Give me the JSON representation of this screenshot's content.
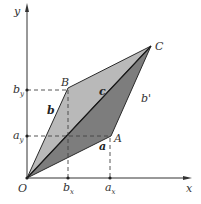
{
  "diagram": {
    "type": "vector-addition-parallelogram",
    "axes": {
      "x_label": "x",
      "y_label": "y",
      "origin_label": "O"
    },
    "points": {
      "O": {
        "label": "O",
        "px": [
          27,
          178
        ]
      },
      "A": {
        "label": "A",
        "px": [
          111,
          136
        ]
      },
      "B": {
        "label": "B",
        "px": [
          68,
          88
        ]
      },
      "C": {
        "label": "C",
        "px": [
          151,
          46
        ]
      }
    },
    "vectors": {
      "a": {
        "label": "a",
        "from": "O",
        "to": "A"
      },
      "b": {
        "label": "b",
        "from": "O",
        "to": "B"
      },
      "c": {
        "label": "c",
        "from": "O",
        "to": "C"
      },
      "b_prime": {
        "label": "b'",
        "from": "A",
        "to": "C"
      }
    },
    "ticks": {
      "x": [
        {
          "base": "b",
          "sub": "x"
        },
        {
          "base": "a",
          "sub": "x"
        }
      ],
      "y": [
        {
          "base": "b",
          "sub": "y"
        },
        {
          "base": "a",
          "sub": "y"
        }
      ]
    },
    "colors": {
      "light_triangle": "#b9b9b9",
      "dark_triangle": "#7d7d7d",
      "stroke": "#2a2a2a",
      "dashed": "#444444"
    }
  }
}
